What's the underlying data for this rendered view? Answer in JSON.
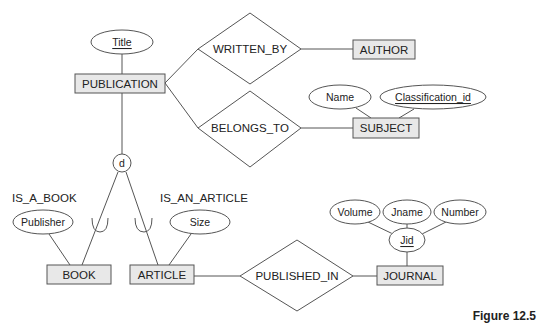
{
  "diagram": {
    "type": "EER diagram",
    "figure_caption": "Figure 12.5",
    "entities": [
      {
        "id": "publication",
        "label": "PUBLICATION"
      },
      {
        "id": "author",
        "label": "AUTHOR"
      },
      {
        "id": "subject",
        "label": "SUBJECT"
      },
      {
        "id": "book",
        "label": "BOOK"
      },
      {
        "id": "article",
        "label": "ARTICLE"
      },
      {
        "id": "journal",
        "label": "JOURNAL"
      }
    ],
    "relationships": [
      {
        "id": "written_by",
        "label": "WRITTEN_BY",
        "connects": [
          "PUBLICATION",
          "AUTHOR"
        ]
      },
      {
        "id": "belongs_to",
        "label": "BELONGS_TO",
        "connects": [
          "PUBLICATION",
          "SUBJECT"
        ]
      },
      {
        "id": "published_in",
        "label": "PUBLISHED_IN",
        "connects": [
          "ARTICLE",
          "JOURNAL"
        ]
      }
    ],
    "attributes": [
      {
        "id": "title",
        "label": "Title",
        "owner": "PUBLICATION",
        "key": true
      },
      {
        "id": "name",
        "label": "Name",
        "owner": "SUBJECT",
        "key": false
      },
      {
        "id": "classification_id",
        "label": "Classification_id",
        "owner": "SUBJECT",
        "key": true
      },
      {
        "id": "publisher",
        "label": "Publisher",
        "owner": "BOOK",
        "key": false
      },
      {
        "id": "size",
        "label": "Size",
        "owner": "ARTICLE",
        "key": false
      },
      {
        "id": "jid",
        "label": "Jid",
        "owner": "JOURNAL",
        "key": true,
        "composite": true
      },
      {
        "id": "volume",
        "label": "Volume",
        "owner": "Jid",
        "key": false
      },
      {
        "id": "jname",
        "label": "Jname",
        "owner": "Jid",
        "key": false
      },
      {
        "id": "number",
        "label": "Number",
        "owner": "Jid",
        "key": false
      }
    ],
    "specialization": {
      "symbol": "d",
      "superclass": "PUBLICATION",
      "subclasses": [
        "BOOK",
        "ARTICLE"
      ],
      "labels": [
        {
          "id": "is_a_book",
          "label": "IS_A_BOOK"
        },
        {
          "id": "is_an_article",
          "label": "IS_AN_ARTICLE"
        }
      ]
    },
    "colors": {
      "entity_fill": "#e8e8e8",
      "stroke": "#555555",
      "text": "#222222",
      "background": "#ffffff"
    }
  }
}
